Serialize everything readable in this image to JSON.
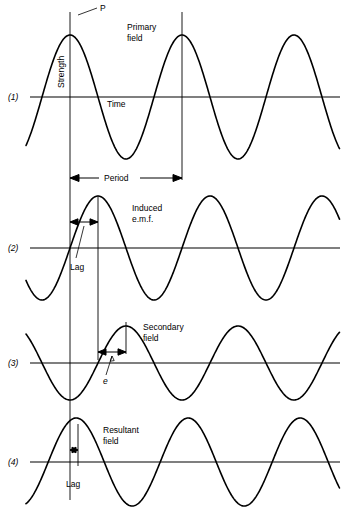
{
  "figure": {
    "background": "#ffffff",
    "stroke": "#000000",
    "width": 344,
    "height": 522
  },
  "axes": {
    "strength_label": "Strength",
    "time_label": "Time"
  },
  "annotations": {
    "peak_marker": "P",
    "period_label": "Period",
    "lag_label_2": "Lag",
    "lag_label_4": "Lag",
    "emf_symbol": "e"
  },
  "panels": [
    {
      "id": "1",
      "tag": "(1)",
      "title_line1": "Primary",
      "title_line2": "field",
      "title": "Primary field",
      "baseline_y": 97,
      "amplitude": 62,
      "phase_deg": 0,
      "lag_deg": 0,
      "x_start": 26,
      "x_end": 340,
      "wavelength": 112
    },
    {
      "id": "2",
      "tag": "(2)",
      "title_line1": "Induced",
      "title_line2": "e.m.f.",
      "title": "Induced e.m.f.",
      "baseline_y": 248,
      "amplitude": 52,
      "phase_deg": 90,
      "lag_deg": 90,
      "x_start": 26,
      "x_end": 340,
      "wavelength": 112
    },
    {
      "id": "3",
      "tag": "(3)",
      "title_line1": "Secondary",
      "title_line2": "field",
      "title": "Secondary field",
      "baseline_y": 363,
      "amplitude": 37,
      "phase_deg": 180,
      "lag_deg": 180,
      "x_start": 26,
      "x_end": 340,
      "wavelength": 112
    },
    {
      "id": "4",
      "tag": "(4)",
      "title_line1": "Resultant",
      "title_line2": "field",
      "title": "Resultant field",
      "baseline_y": 462,
      "amplitude": 44,
      "phase_deg": 20,
      "lag_deg": 20,
      "x_start": 26,
      "x_end": 340,
      "wavelength": 112
    }
  ],
  "chart_data": {
    "type": "line",
    "xlabel": "Time",
    "ylabel": "Strength",
    "grid": false,
    "legend": "none",
    "x_units": "pixels along time axis",
    "period_px": 112,
    "period_span_px": [
      70,
      182
    ],
    "reference_line_x": 70,
    "series": [
      {
        "name": "Primary field",
        "panel": "1",
        "amplitude": 62,
        "phase_deg": 0,
        "peak_x": 70,
        "annotation": "P"
      },
      {
        "name": "Induced e.m.f.",
        "panel": "2",
        "amplitude": 52,
        "phase_deg": 90,
        "peak_x": 98,
        "lag_span_px": [
          70,
          98
        ]
      },
      {
        "name": "Secondary field",
        "panel": "3",
        "amplitude": 37,
        "phase_deg": 180,
        "peak_x": 126,
        "emf_span_px": [
          98,
          126
        ]
      },
      {
        "name": "Resultant field",
        "panel": "4",
        "amplitude": 44,
        "phase_deg": 20,
        "peak_x": 77,
        "lag_span_px": [
          70,
          77
        ]
      }
    ]
  }
}
